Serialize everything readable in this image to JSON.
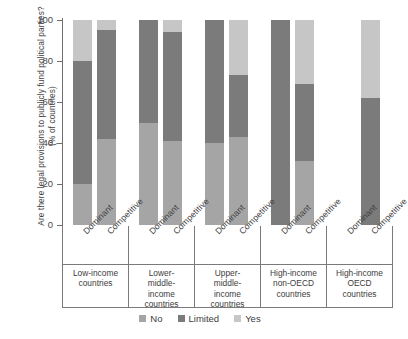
{
  "chart_data": {
    "type": "bar",
    "subtype": "stacked-bar-100",
    "title": "",
    "ylabel": "Are there legal provisions to publicly fund political parties? (% of countries)",
    "xlabel": "",
    "ylim": [
      0,
      100
    ],
    "yticks": [
      0,
      20,
      40,
      60,
      80,
      100
    ],
    "ytick_labels": [
      "0",
      "20",
      "40",
      "60",
      "80",
      "100"
    ],
    "grid": false,
    "legend_position": "bottom",
    "legend": [
      "No",
      "Limited",
      "Yes"
    ],
    "series_colors": {
      "No": "#a5a5a5",
      "Limited": "#7b7b7b",
      "Yes": "#c6c6c6"
    },
    "groups": [
      "Low-income countries",
      "Lower-middle-income countries",
      "Upper-middle-income countries",
      "High-income non-OECD countries",
      "High-income OECD countries"
    ],
    "subcategories": [
      "Dominant",
      "Competitive"
    ],
    "categories": [
      "Low-income / Dominant",
      "Low-income / Competitive",
      "Lower-middle-income / Dominant",
      "Lower-middle-income / Competitive",
      "Upper-middle-income / Dominant",
      "Upper-middle-income / Competitive",
      "High-income non-OECD / Dominant",
      "High-income non-OECD / Competitive",
      "High-income OECD / Dominant",
      "High-income OECD / Competitive"
    ],
    "series": [
      {
        "name": "No",
        "values": [
          20,
          42,
          50,
          41,
          40,
          43,
          0,
          31,
          0,
          0
        ]
      },
      {
        "name": "Limited",
        "values": [
          60,
          53,
          50,
          53,
          60,
          30,
          100,
          38,
          0,
          62
        ]
      },
      {
        "name": "Yes",
        "values": [
          20,
          5,
          0,
          6,
          0,
          27,
          0,
          31,
          0,
          38
        ]
      }
    ],
    "bars": [
      {
        "group": 0,
        "sub": "Dominant",
        "no": 20,
        "limited": 60,
        "yes": 20,
        "empty": false
      },
      {
        "group": 0,
        "sub": "Competitive",
        "no": 42,
        "limited": 53,
        "yes": 5,
        "empty": false
      },
      {
        "group": 1,
        "sub": "Dominant",
        "no": 50,
        "limited": 50,
        "yes": 0,
        "empty": false
      },
      {
        "group": 1,
        "sub": "Competitive",
        "no": 41,
        "limited": 53,
        "yes": 6,
        "empty": false
      },
      {
        "group": 2,
        "sub": "Dominant",
        "no": 40,
        "limited": 60,
        "yes": 0,
        "empty": false
      },
      {
        "group": 2,
        "sub": "Competitive",
        "no": 43,
        "limited": 30,
        "yes": 27,
        "empty": false
      },
      {
        "group": 3,
        "sub": "Dominant",
        "no": 0,
        "limited": 100,
        "yes": 0,
        "empty": false
      },
      {
        "group": 3,
        "sub": "Competitive",
        "no": 31,
        "limited": 38,
        "yes": 31,
        "empty": false
      },
      {
        "group": 4,
        "sub": "Dominant",
        "no": 0,
        "limited": 0,
        "yes": 0,
        "empty": true
      },
      {
        "group": 4,
        "sub": "Competitive",
        "no": 0,
        "limited": 62,
        "yes": 38,
        "empty": false
      }
    ]
  },
  "axis": {
    "y_title": "Are there legal provisions to publicly fund political parties? (% of countries)",
    "y_ticks": [
      "100",
      "80",
      "60",
      "40",
      "20",
      "0"
    ]
  },
  "groups": [
    {
      "line1": "Low-income",
      "line2": "countries",
      "line3": "",
      "line4": ""
    },
    {
      "line1": "Lower-",
      "line2": "middle-",
      "line3": "income",
      "line4": "countries"
    },
    {
      "line1": "Upper-",
      "line2": "middle-",
      "line3": "income",
      "line4": "countries"
    },
    {
      "line1": "High-income",
      "line2": "non-OECD",
      "line3": "countries",
      "line4": ""
    },
    {
      "line1": "High-income",
      "line2": "OECD",
      "line3": "countries",
      "line4": ""
    }
  ],
  "xlabels": [
    "Dominant",
    "Competitive",
    "Dominant",
    "Competitive",
    "Dominant",
    "Competitive",
    "Dominant",
    "Competitive",
    "Dominant",
    "Competitive"
  ],
  "legend": [
    {
      "label": "No",
      "color": "#a5a5a5"
    },
    {
      "label": "Limited",
      "color": "#7b7b7b"
    },
    {
      "label": "Yes",
      "color": "#c6c6c6"
    }
  ]
}
